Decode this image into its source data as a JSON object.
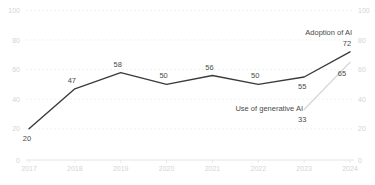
{
  "chart_data": {
    "type": "line",
    "title": "",
    "xlabel": "",
    "ylabel": "",
    "categories": [
      "2017",
      "2018",
      "2019",
      "2020",
      "2021",
      "2022",
      "2023",
      "2024"
    ],
    "ylim": [
      0,
      100
    ],
    "yticks": [
      0,
      20,
      40,
      60,
      80,
      100
    ],
    "grid": "horizontal-dashed",
    "legend_position": "inline-annotations",
    "series": [
      {
        "name": "Adoption of AI",
        "color": "#3b3b3b",
        "values": [
          20,
          47,
          58,
          50,
          56,
          50,
          55,
          72
        ],
        "label_positions": [
          "below",
          "above",
          "above",
          "above",
          "above",
          "above",
          "below",
          "above"
        ]
      },
      {
        "name": "Use of generative AI",
        "color": "#d9d9d9",
        "values": [
          null,
          null,
          null,
          null,
          null,
          null,
          33,
          65
        ],
        "label_positions": [
          null,
          null,
          null,
          null,
          null,
          null,
          "below",
          "left-below"
        ]
      }
    ],
    "colors": {
      "axis_line": "#e4e4e4",
      "gridline": "#ededed",
      "tick_label": "#d4d4d4",
      "data_label": "#4a4a4a",
      "background": "#ffffff"
    }
  }
}
